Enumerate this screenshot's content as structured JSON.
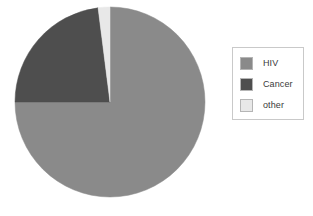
{
  "chart_data": {
    "type": "pie",
    "title": "",
    "legend_position": "right",
    "categories": [
      "HIV",
      "Cancer",
      "other"
    ],
    "values": [
      75,
      23,
      2
    ],
    "unit": "percent",
    "colors": [
      "#8a8a8a",
      "#4e4e4e",
      "#e8e8e8"
    ],
    "start_angle_deg": 0,
    "direction": "clockwise",
    "slices": [
      {
        "label": "HIV",
        "value": 75,
        "color": "#8a8a8a",
        "start_deg": 0,
        "end_deg": 270
      },
      {
        "label": "Cancer",
        "value": 23,
        "color": "#4e4e4e",
        "start_deg": 270,
        "end_deg": 352.8
      },
      {
        "label": "other",
        "value": 2,
        "color": "#e8e8e8",
        "start_deg": 352.8,
        "end_deg": 360
      }
    ]
  },
  "legend": {
    "items": [
      {
        "label": "HIV",
        "swatch_color": "#8a8a8a",
        "swatch_name": "legend-swatch-hiv"
      },
      {
        "label": "Cancer",
        "swatch_color": "#4e4e4e",
        "swatch_name": "legend-swatch-cancer"
      },
      {
        "label": "other",
        "swatch_color": "#e8e8e8",
        "swatch_name": "legend-swatch-other"
      }
    ]
  },
  "caption": {
    "text": ""
  }
}
